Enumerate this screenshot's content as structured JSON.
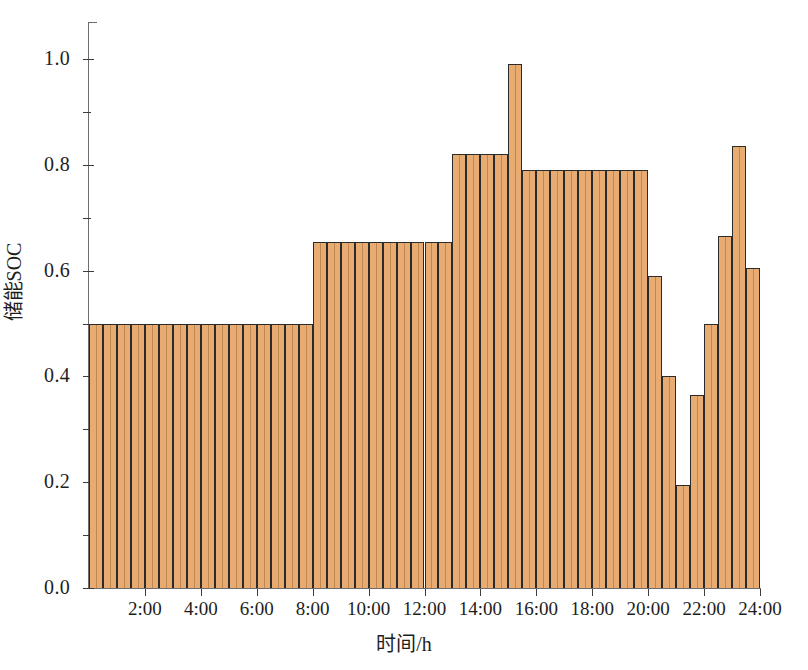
{
  "chart_data": {
    "type": "bar",
    "title": "",
    "xlabel": "时间/h",
    "ylabel": "储能SOC",
    "xlim": [
      0,
      24
    ],
    "ylim": [
      0.0,
      1.07
    ],
    "grid": false,
    "legend": null,
    "bar_color": "#e8ab72",
    "bar_edge_color": "#2b2b2b",
    "y_ticks": [
      0.0,
      0.2,
      0.4,
      0.6,
      0.8,
      1.0
    ],
    "y_tick_labels": [
      "0.0",
      "0.2",
      "0.4",
      "0.6",
      "0.8",
      "1.0"
    ],
    "y_minor_ticks": [
      0.1,
      0.3,
      0.5,
      0.7,
      0.9
    ],
    "x_ticks": [
      2,
      4,
      6,
      8,
      10,
      12,
      14,
      16,
      18,
      20,
      22,
      24
    ],
    "x_tick_labels": [
      "2:00",
      "4:00",
      "6:00",
      "8:00",
      "10:00",
      "12:00",
      "14:00",
      "16:00",
      "18:00",
      "20:00",
      "22:00",
      "24:00"
    ],
    "x": [
      0.25,
      0.75,
      1.25,
      1.75,
      2.25,
      2.75,
      3.25,
      3.75,
      4.25,
      4.75,
      5.25,
      5.75,
      6.25,
      6.75,
      7.25,
      7.75,
      8.25,
      8.75,
      9.25,
      9.75,
      10.25,
      10.75,
      11.25,
      11.75,
      12.25,
      12.75,
      13.25,
      13.75,
      14.25,
      14.75,
      15.25,
      15.75,
      16.25,
      16.75,
      17.25,
      17.75,
      18.25,
      18.75,
      19.25,
      19.75,
      20.25,
      20.75,
      21.25,
      21.75,
      22.25,
      22.75,
      23.25,
      23.75
    ],
    "values": [
      0.5,
      0.5,
      0.5,
      0.5,
      0.5,
      0.5,
      0.5,
      0.5,
      0.5,
      0.5,
      0.5,
      0.5,
      0.5,
      0.5,
      0.5,
      0.5,
      0.655,
      0.655,
      0.655,
      0.655,
      0.655,
      0.655,
      0.655,
      0.655,
      0.655,
      0.655,
      0.82,
      0.82,
      0.82,
      0.82,
      0.99,
      0.79,
      0.79,
      0.79,
      0.79,
      0.79,
      0.79,
      0.79,
      0.79,
      0.79,
      0.59,
      0.4,
      0.195,
      0.365,
      0.5,
      0.665,
      0.835,
      0.605
    ]
  },
  "axes": {
    "y_title": "储能SOC",
    "x_title": "时间/h"
  }
}
